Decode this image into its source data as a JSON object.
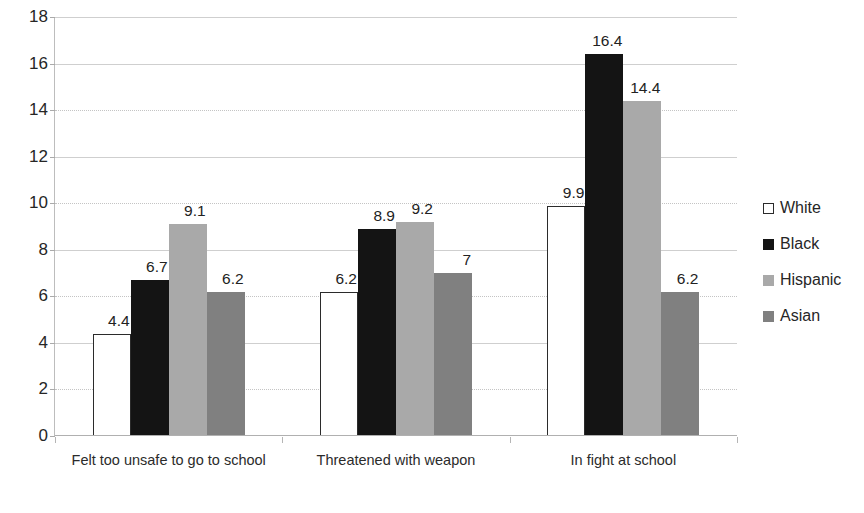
{
  "chart_data": {
    "type": "bar",
    "title": "",
    "subtitle": "",
    "xlabel": "",
    "ylabel": "",
    "ylim": [
      0,
      18
    ],
    "y_ticks": [
      0,
      2,
      4,
      6,
      8,
      10,
      12,
      14,
      16,
      18
    ],
    "grid": true,
    "legend_position": "right",
    "categories": [
      "Felt too unsafe to go to school",
      "Threatened with weapon",
      "In fight at school"
    ],
    "series": [
      {
        "name": "White",
        "color": "#ffffff",
        "values": [
          4.4,
          6.2,
          9.9
        ],
        "labels": [
          "4.4",
          "6.2",
          "9.9"
        ]
      },
      {
        "name": "Black",
        "color": "#141414",
        "values": [
          6.7,
          8.9,
          16.4
        ],
        "labels": [
          "6.7",
          "8.9",
          "16.4"
        ]
      },
      {
        "name": "Hispanic",
        "color": "#a9a9a9",
        "values": [
          9.1,
          9.2,
          14.4
        ],
        "labels": [
          "9.1",
          "9.2",
          "14.4"
        ]
      },
      {
        "name": "Asian",
        "color": "#808080",
        "values": [
          6.2,
          7.0,
          6.2
        ],
        "labels": [
          "6.2",
          "7",
          "6.2"
        ]
      }
    ]
  },
  "axis": {
    "y_tick_labels": [
      "18",
      "16",
      "14",
      "12",
      "10",
      "8",
      "6",
      "4",
      "2",
      "0"
    ]
  },
  "legend": {
    "items": [
      {
        "label": "White",
        "swatch": "white-swatch"
      },
      {
        "label": "Black",
        "swatch": "black-swatch"
      },
      {
        "label": "Hispanic",
        "swatch": "hispanic-swatch"
      },
      {
        "label": "Asian",
        "swatch": "asian-swatch"
      }
    ]
  }
}
